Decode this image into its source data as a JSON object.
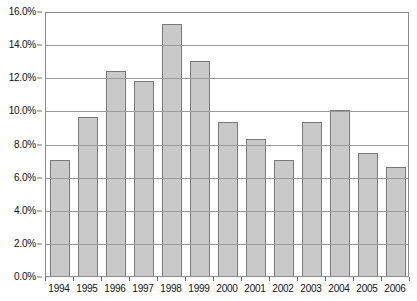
{
  "chart_data": {
    "type": "bar",
    "title": "",
    "subtitle": "",
    "xlabel": "",
    "ylabel": "",
    "categories": [
      "1994",
      "1995",
      "1996",
      "1997",
      "1998",
      "1999",
      "2000",
      "2001",
      "2002",
      "2003",
      "2004",
      "2005",
      "2006"
    ],
    "values": [
      7.0,
      9.6,
      12.4,
      11.8,
      15.2,
      13.0,
      9.3,
      8.3,
      7.0,
      9.3,
      10.0,
      7.4,
      6.6
    ],
    "value_format": "percent",
    "ylim": [
      0.0,
      16.0
    ],
    "ytick_values": [
      0.0,
      2.0,
      4.0,
      6.0,
      8.0,
      10.0,
      12.0,
      14.0,
      16.0
    ],
    "ytick_labels": [
      "0.0%",
      "2.0%",
      "4.0%",
      "6.0%",
      "8.0%",
      "10.0%",
      "12.0%",
      "14.0%",
      "16.0%"
    ],
    "gridline_values": [
      2.0,
      4.0,
      6.0,
      8.0,
      10.0,
      12.0,
      14.0
    ],
    "grid": true,
    "grid_axis": "y",
    "legend": false,
    "legend_position": "none",
    "annotations": [],
    "colors": {
      "bar_fill": "#c9c9c9",
      "bar_border": "#777777",
      "gridline": "#9a9a9a",
      "frame": "#8c8c8c",
      "text": "#101010",
      "background": "#ffffff"
    }
  }
}
